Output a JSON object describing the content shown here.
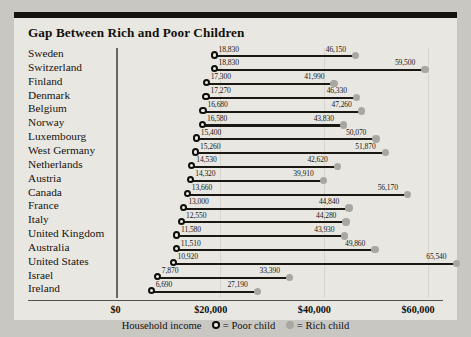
{
  "chart_data": {
    "type": "bar",
    "title": "Gap Between Rich and Poor Children",
    "xlabel": "Household income",
    "ylabel": "",
    "xlim": [
      0,
      70000
    ],
    "grid": true,
    "legend_position": "bottom",
    "xticks": [
      "$0",
      "$20,000",
      "$40,000",
      "$60,000"
    ],
    "xtick_values": [
      0,
      20000,
      40000,
      60000
    ],
    "legend": [
      {
        "label": "= Poor child",
        "marker": "open-circle"
      },
      {
        "label": "= Rich child",
        "marker": "filled-circle"
      }
    ],
    "series": [
      {
        "name": "Poor child",
        "values": [
          18830,
          18830,
          17300,
          17270,
          16680,
          16580,
          15400,
          15260,
          14530,
          14320,
          13660,
          13000,
          12550,
          11580,
          11510,
          10920,
          7870,
          6690
        ]
      },
      {
        "name": "Rich child",
        "values": [
          46150,
          59500,
          41990,
          46330,
          47260,
          43830,
          50070,
          51870,
          42620,
          39910,
          56170,
          44840,
          44280,
          43930,
          49860,
          65540,
          33390,
          27190
        ]
      }
    ],
    "categories": [
      "Sweden",
      "Switzerland",
      "Finland",
      "Denmark",
      "Belgium",
      "Norway",
      "Luxembourg",
      "West Germany",
      "Netherlands",
      "Austria",
      "Canada",
      "France",
      "Italy",
      "United Kingdom",
      "Australia",
      "United States",
      "Israel",
      "Ireland"
    ],
    "rows": [
      {
        "country": "Sweden",
        "poor": 18830,
        "rich": 46150,
        "poor_label": "18,830",
        "rich_label": "46,150"
      },
      {
        "country": "Switzerland",
        "poor": 18830,
        "rich": 59500,
        "poor_label": "18,830",
        "rich_label": "59,500"
      },
      {
        "country": "Finland",
        "poor": 17300,
        "rich": 41990,
        "poor_label": "17,300",
        "rich_label": "41,990"
      },
      {
        "country": "Denmark",
        "poor": 17270,
        "rich": 46330,
        "poor_label": "17,270",
        "rich_label": "46,330"
      },
      {
        "country": "Belgium",
        "poor": 16680,
        "rich": 47260,
        "poor_label": "16,680",
        "rich_label": "47,260"
      },
      {
        "country": "Norway",
        "poor": 16580,
        "rich": 43830,
        "poor_label": "16,580",
        "rich_label": "43,830"
      },
      {
        "country": "Luxembourg",
        "poor": 15400,
        "rich": 50070,
        "poor_label": "15,400",
        "rich_label": "50,070"
      },
      {
        "country": "West Germany",
        "poor": 15260,
        "rich": 51870,
        "poor_label": "15,260",
        "rich_label": "51,870"
      },
      {
        "country": "Netherlands",
        "poor": 14530,
        "rich": 42620,
        "poor_label": "14,530",
        "rich_label": "42,620"
      },
      {
        "country": "Austria",
        "poor": 14320,
        "rich": 39910,
        "poor_label": "14,320",
        "rich_label": "39,910"
      },
      {
        "country": "Canada",
        "poor": 13660,
        "rich": 56170,
        "poor_label": "13,660",
        "rich_label": "56,170"
      },
      {
        "country": "France",
        "poor": 13000,
        "rich": 44840,
        "poor_label": "13,000",
        "rich_label": "44,840"
      },
      {
        "country": "Italy",
        "poor": 12550,
        "rich": 44280,
        "poor_label": "12,550",
        "rich_label": "44,280"
      },
      {
        "country": "United Kingdom",
        "poor": 11580,
        "rich": 43930,
        "poor_label": "11,580",
        "rich_label": "43,930"
      },
      {
        "country": "Australia",
        "poor": 11510,
        "rich": 49860,
        "poor_label": "11,510",
        "rich_label": "49,860"
      },
      {
        "country": "United States",
        "poor": 10920,
        "rich": 65540,
        "poor_label": "10,920",
        "rich_label": "65,540"
      },
      {
        "country": "Israel",
        "poor": 7870,
        "rich": 33390,
        "poor_label": "7,870",
        "rich_label": "33,390"
      },
      {
        "country": "Ireland",
        "poor": 6690,
        "rich": 27190,
        "poor_label": "6,690",
        "rich_label": "27,190"
      }
    ]
  },
  "colors": {
    "background": "#c9c7c2",
    "panel": "#e9e7e2",
    "bar": "#1b1814",
    "rich_marker": "#a9a7a2",
    "poor_marker_edge": "#100e0b",
    "topbar": "#16130f"
  }
}
